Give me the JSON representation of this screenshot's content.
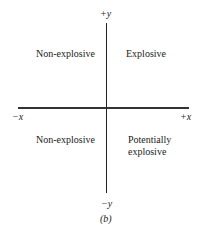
{
  "figure": {
    "caption": "(b)",
    "axes": {
      "x_positive": "+x",
      "x_negative": "−x",
      "y_positive": "+y",
      "y_negative": "−y"
    },
    "quadrants": {
      "top_left": "Non-explosive",
      "top_right": "Explosive",
      "bottom_left": "Non-explosive",
      "bottom_right_line1": "Potentially",
      "bottom_right_line2": "explosive"
    }
  }
}
